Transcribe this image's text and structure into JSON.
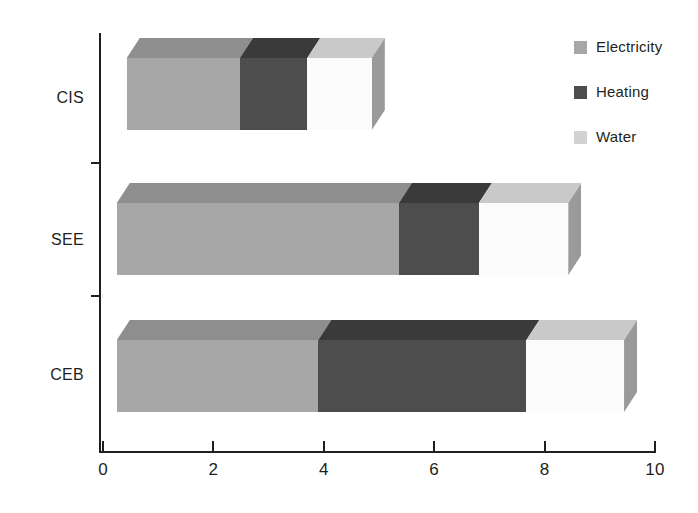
{
  "chart_data": {
    "type": "bar",
    "orientation": "horizontal",
    "stacked": true,
    "style": "3d-extruded",
    "title": "",
    "subtitle": "",
    "xlabel": "",
    "ylabel": "",
    "categories": [
      "CIS",
      "SEE",
      "CEB"
    ],
    "series": [
      {
        "name": "Electricity",
        "color": "#a7a7a7",
        "values": [
          2.05,
          5.1,
          3.65
        ]
      },
      {
        "name": "Heating",
        "color": "#4d4d4d",
        "values": [
          1.22,
          1.45,
          3.77
        ]
      },
      {
        "name": "Water",
        "color": "#fbfbfb",
        "values": [
          1.17,
          1.62,
          1.77
        ]
      }
    ],
    "stack_totals": [
      4.44,
      8.17,
      9.19
    ],
    "bar_start_offset": 0.43,
    "cumulative_edges": {
      "CIS": [
        0.43,
        2.48,
        3.7,
        4.87
      ],
      "SEE": [
        0.25,
        5.36,
        6.81,
        8.43
      ],
      "CEB": [
        0.25,
        3.9,
        7.67,
        9.44
      ]
    },
    "xlim": [
      0,
      10
    ],
    "x_ticks": [
      "0",
      "2",
      "4",
      "6",
      "8",
      "10"
    ],
    "x_tick_values": [
      0,
      2,
      4,
      6,
      8,
      10
    ],
    "grid": false,
    "legend_position": "top-right",
    "legend": [
      "Electricity",
      "Heating",
      "Water"
    ]
  },
  "legend": {
    "items": [
      {
        "label": "Electricity",
        "swatch_color": "#a7a7a7"
      },
      {
        "label": "Heating",
        "swatch_color": "#4d4d4d"
      },
      {
        "label": "Water",
        "swatch_color": "#d2d2d2"
      }
    ]
  },
  "axes": {
    "x_tick_labels": [
      "0",
      "2",
      "4",
      "6",
      "8",
      "10"
    ],
    "y_category_labels": [
      "CIS",
      "SEE",
      "CEB"
    ]
  },
  "colors": {
    "axis": "#231f20",
    "text": "#231f20",
    "background": "#ffffff",
    "electricity_front": "#a7a7a7",
    "electricity_top": "#8e8e8e",
    "electricity_side": "#8a8a8a",
    "heating_front": "#4d4d4d",
    "heating_top": "#3a3a3a",
    "heating_side": "#3c3c3c",
    "water_front": "#fbfbfb",
    "water_top": "#c9c9c9",
    "water_side": "#9a9a9a"
  }
}
